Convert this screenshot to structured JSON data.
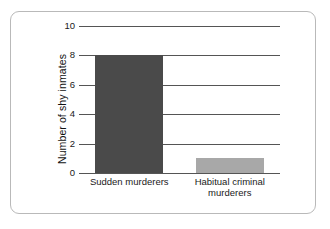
{
  "figure": {
    "background_color": "#ffffff",
    "border_color": "#b9b9b9"
  },
  "chart_data": {
    "type": "bar",
    "title": "",
    "subtitle": "",
    "xlabel": "",
    "ylabel": "Number of shy inmates",
    "categories": [
      "Sudden murderers",
      "Habitual criminal\nmurderers"
    ],
    "values": [
      8,
      1
    ],
    "series": [
      {
        "name": "Number of shy inmates",
        "values": [
          8,
          1
        ]
      }
    ],
    "bar_colors": [
      "#4a4a4a",
      "#a8a8a8"
    ],
    "ylim": [
      0,
      10
    ],
    "yticks": [
      0,
      2,
      4,
      6,
      8,
      10
    ],
    "ytick_labels": [
      "0",
      "2",
      "4",
      "6",
      "8",
      "10"
    ],
    "grid": true,
    "grid_axis": "y",
    "grid_color": "#555555",
    "legend": false,
    "legend_position": "none"
  }
}
